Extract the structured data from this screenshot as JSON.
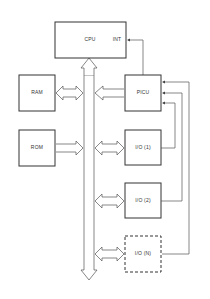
{
  "diagram": {
    "type": "block-diagram",
    "blocks": {
      "cpu": {
        "label": "CPU",
        "port": "INT"
      },
      "ram": {
        "label": "RAM"
      },
      "rom": {
        "label": "ROM"
      },
      "picu": {
        "label": "PICU"
      },
      "io1": {
        "label": "I/O (1)"
      },
      "io2": {
        "label": "I/O (2)"
      },
      "ion": {
        "label": "I/O (N)",
        "style": "dashed"
      }
    },
    "connections": [
      {
        "from": "bus",
        "to": "cpu",
        "kind": "bus-arrow"
      },
      {
        "from": "ram",
        "to": "bus",
        "kind": "bidirectional"
      },
      {
        "from": "picu",
        "to": "bus",
        "kind": "unidirectional"
      },
      {
        "from": "rom",
        "to": "bus",
        "kind": "unidirectional"
      },
      {
        "from": "io1",
        "to": "bus",
        "kind": "bidirectional"
      },
      {
        "from": "io2",
        "to": "bus",
        "kind": "bidirectional"
      },
      {
        "from": "ion",
        "to": "bus",
        "kind": "bidirectional"
      },
      {
        "from": "picu",
        "to": "cpu.INT",
        "kind": "signal"
      },
      {
        "from": "io1",
        "to": "picu",
        "kind": "signal"
      },
      {
        "from": "io2",
        "to": "picu",
        "kind": "signal"
      },
      {
        "from": "ion",
        "to": "picu",
        "kind": "signal"
      }
    ]
  }
}
